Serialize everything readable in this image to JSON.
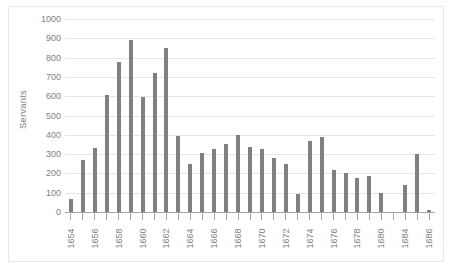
{
  "chart_data": {
    "type": "bar",
    "title": "",
    "xlabel": "",
    "ylabel": "Servants",
    "ylim": [
      0,
      1000
    ],
    "ytick_values": [
      1000,
      900,
      800,
      700,
      600,
      500,
      400,
      300,
      200,
      100,
      0
    ],
    "ytick_labels": [
      "1000",
      "900",
      "800",
      "700",
      "600",
      "500",
      "400",
      "300",
      "200",
      "100",
      "0"
    ],
    "grid": true,
    "legend": false,
    "bar_color": "#808080",
    "axis_color": "#a6a6a6",
    "gridline_color": "#e6e6e6",
    "tick_label_color": "#808080",
    "categories": [
      "1654",
      "1655",
      "1656",
      "1657",
      "1658",
      "1659",
      "1660",
      "1661",
      "1662",
      "1663",
      "1664",
      "1665",
      "1666",
      "1667",
      "1668",
      "1669",
      "1670",
      "1671",
      "1672",
      "1673",
      "1674",
      "1675",
      "1676",
      "1677",
      "1678",
      "1679",
      "1680",
      "1681",
      "1684",
      "1685",
      "1686"
    ],
    "values": [
      65,
      267,
      332,
      607,
      777,
      893,
      595,
      718,
      848,
      392,
      247,
      306,
      329,
      352,
      398,
      338,
      328,
      280,
      250,
      92,
      366,
      391,
      220,
      202,
      175,
      186,
      101,
      0,
      138,
      299,
      12
    ],
    "visible_xtick_labels": [
      "1654",
      "",
      "1656",
      "",
      "1658",
      "",
      "1660",
      "",
      "1662",
      "",
      "1664",
      "",
      "1666",
      "",
      "1668",
      "",
      "1670",
      "",
      "1672",
      "",
      "1674",
      "",
      "1676",
      "",
      "1678",
      "",
      "1680",
      "",
      "1684",
      "",
      "1686"
    ]
  }
}
